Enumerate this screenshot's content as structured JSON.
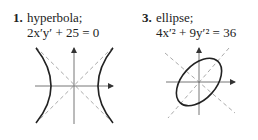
{
  "problems": [
    {
      "number": "1.",
      "type": "hyperbola;",
      "equation": "2x′y′ + 25 = 0"
    },
    {
      "number": "3.",
      "type": "ellipse;",
      "equation": "4x′² + 9y′² = 36"
    }
  ],
  "colors": {
    "curve": "#222222",
    "axis": "#555555",
    "dashed": "#aaaaaa"
  }
}
